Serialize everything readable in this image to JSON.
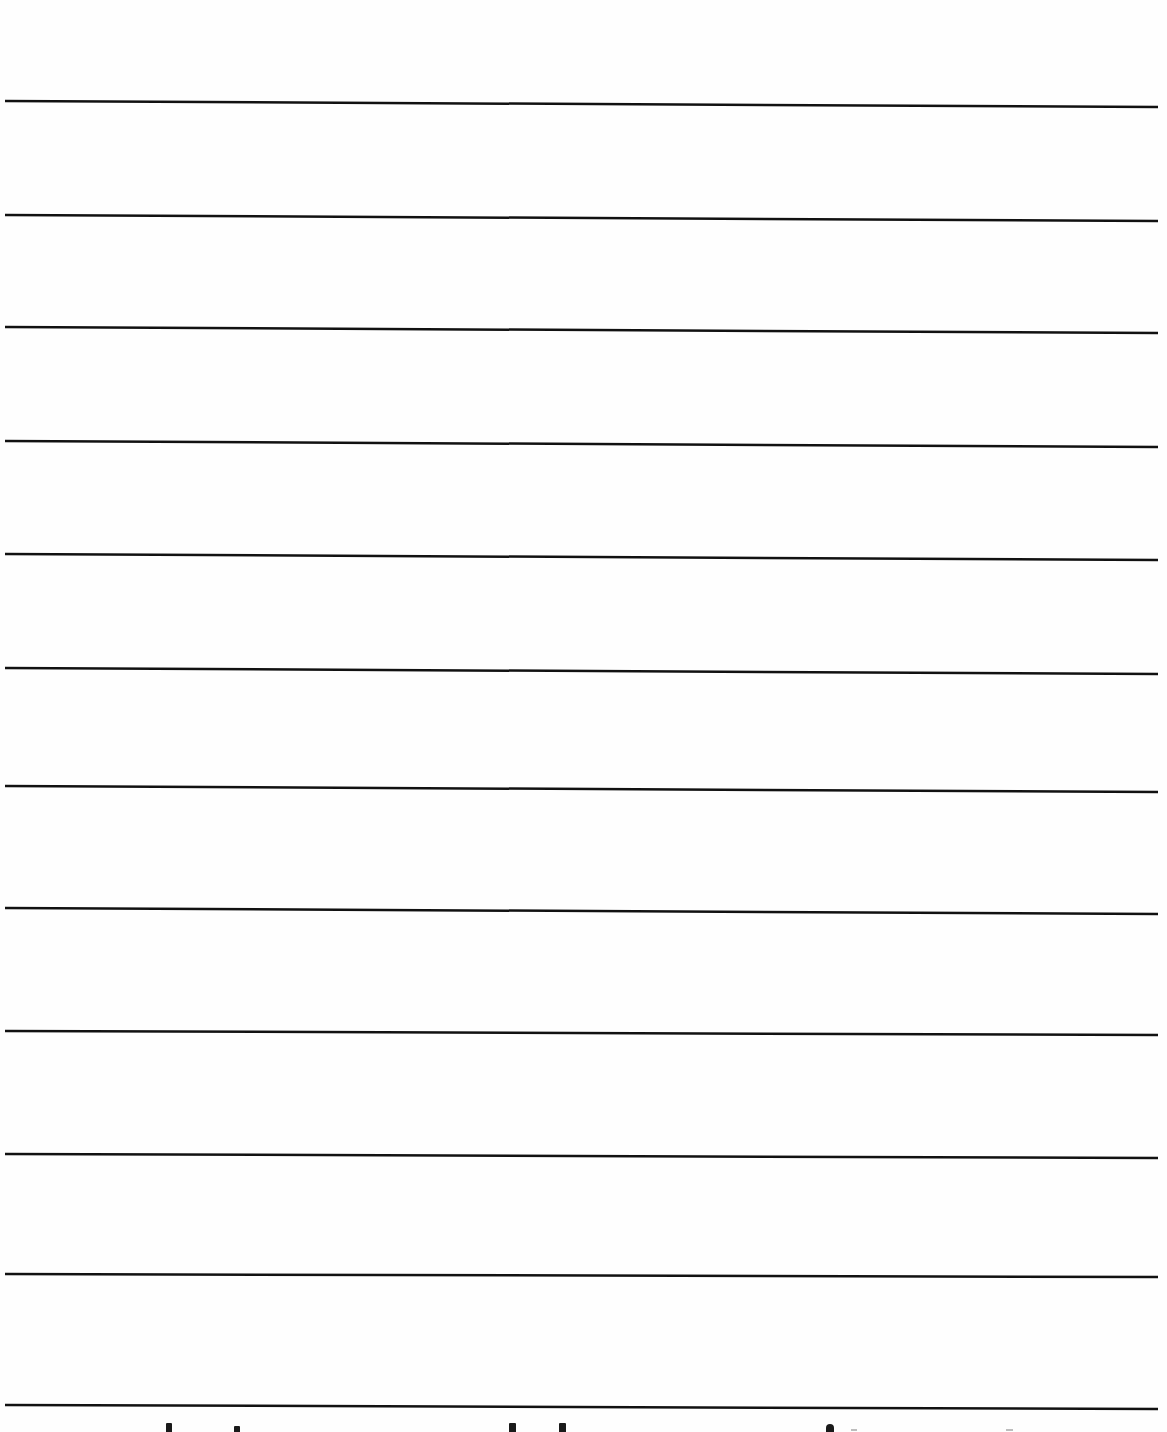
{
  "page": {
    "type": "ruled-lined-paper",
    "background": "#fefefe",
    "line_color": "#111111",
    "line_width_px": 2.5,
    "line_x_start": 5,
    "line_x_end": 1158,
    "lines": [
      {
        "y_left": 101,
        "y_right": 107
      },
      {
        "y_left": 215,
        "y_right": 221
      },
      {
        "y_left": 327,
        "y_right": 333
      },
      {
        "y_left": 441,
        "y_right": 447
      },
      {
        "y_left": 554,
        "y_right": 560
      },
      {
        "y_left": 668,
        "y_right": 674
      },
      {
        "y_left": 786,
        "y_right": 792
      },
      {
        "y_left": 908,
        "y_right": 914
      },
      {
        "y_left": 1031,
        "y_right": 1035
      },
      {
        "y_left": 1154,
        "y_right": 1158
      },
      {
        "y_left": 1274,
        "y_right": 1277
      },
      {
        "y_left": 1405,
        "y_right": 1409
      }
    ]
  },
  "bottom_cutoff_text": {
    "legible": false,
    "marks": [
      {
        "x": 166,
        "y": 1423,
        "w": 6,
        "h": 9,
        "shape": "rect"
      },
      {
        "x": 234,
        "y": 1426,
        "w": 6,
        "h": 6,
        "shape": "rect"
      },
      {
        "x": 509,
        "y": 1423,
        "w": 7,
        "h": 9,
        "shape": "rect"
      },
      {
        "x": 559,
        "y": 1423,
        "w": 7,
        "h": 9,
        "shape": "rect"
      },
      {
        "x": 826,
        "y": 1424,
        "w": 8,
        "h": 8,
        "shape": "round"
      },
      {
        "x": 851,
        "y": 1429,
        "w": 6,
        "h": 2,
        "shape": "faint"
      },
      {
        "x": 1006,
        "y": 1429,
        "w": 7,
        "h": 2,
        "shape": "faint"
      }
    ]
  }
}
